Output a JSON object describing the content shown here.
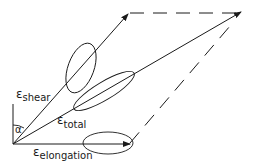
{
  "diagram": {
    "title": "",
    "vectors": [
      {
        "name": "shear",
        "symbol": "ε",
        "subscript": "shear"
      },
      {
        "name": "total",
        "symbol": "ε",
        "subscript": "total"
      },
      {
        "name": "elongation",
        "symbol": "ε",
        "subscript": "elongation"
      }
    ],
    "angle_label": "α",
    "colors": {
      "ink": "#1a1a1a",
      "background": "#ffffff"
    }
  }
}
